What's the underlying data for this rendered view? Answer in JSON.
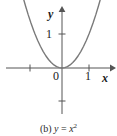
{
  "figure": {
    "caption_prefix": "(b)",
    "caption_equation_lhs": "y",
    "caption_equation_eq": "=",
    "caption_equation_rhs_base": "x",
    "caption_equation_rhs_exp": "2",
    "caption_full": "(b) y = x2",
    "width": 117,
    "height": 136,
    "background_color": "#ffffff"
  },
  "axes": {
    "x_axis_label": "x",
    "y_axis_label": "y",
    "origin_label": "0",
    "x_tick_labels": [
      "1"
    ],
    "y_tick_labels": [
      "1"
    ],
    "axis_color": "#555555",
    "label_color": "#1a1a1a"
  },
  "chart_data": {
    "type": "line",
    "title": "(b) y = x2",
    "xlabel": "x",
    "ylabel": "y",
    "xlim": [
      -1.55,
      1.45
    ],
    "ylim": [
      -1.45,
      2.1
    ],
    "grid": false,
    "legend": false,
    "curve_color": "#7a7a7a",
    "x_ticks": [
      -1,
      1
    ],
    "x_tick_labels_shown": {
      "-1": "",
      "1": "1"
    },
    "y_ticks": [
      -1,
      1
    ],
    "y_tick_labels_shown": {
      "-1": "",
      "1": "1"
    },
    "origin_label": "0",
    "series": [
      {
        "name": "y = x^2",
        "equation": "y = x^2",
        "x": [
          -1.45,
          -1.35,
          -1.25,
          -1.15,
          -1.05,
          -1.0,
          -0.9,
          -0.8,
          -0.7,
          -0.6,
          -0.5,
          -0.4,
          -0.3,
          -0.2,
          -0.1,
          0.0,
          0.1,
          0.2,
          0.3,
          0.4,
          0.5,
          0.6,
          0.7,
          0.8,
          0.9,
          1.0,
          1.05,
          1.15,
          1.25,
          1.35,
          1.45
        ],
        "y": [
          2.1025,
          1.8225,
          1.5625,
          1.3225,
          1.1025,
          1.0,
          0.81,
          0.64,
          0.49,
          0.36,
          0.25,
          0.16,
          0.09,
          0.04,
          0.01,
          0.0,
          0.01,
          0.04,
          0.09,
          0.16,
          0.25,
          0.36,
          0.49,
          0.64,
          0.81,
          1.0,
          1.1025,
          1.3225,
          1.5625,
          1.8225,
          2.1025
        ]
      }
    ]
  }
}
